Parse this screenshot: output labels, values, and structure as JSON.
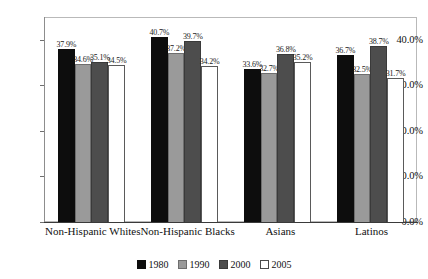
{
  "chart_data": {
    "type": "bar",
    "title": "",
    "subtitle": "",
    "xlabel": "",
    "ylabel": "",
    "categories": [
      "Non-Hispanic Whites",
      "Non-Hispanic Blacks",
      "Asians",
      "Latinos"
    ],
    "series": [
      {
        "name": "1980",
        "color": "#0d0d0d",
        "values": [
          37.9,
          40.7,
          33.6,
          36.7
        ],
        "labels": [
          "37.9%",
          "40.7%",
          "33.6%",
          "36.7%"
        ]
      },
      {
        "name": "1990",
        "color": "#9a9a9a",
        "values": [
          34.6,
          37.2,
          32.7,
          32.5
        ],
        "labels": [
          "34.6%",
          "37.2%",
          "32.7%",
          "32.5%"
        ]
      },
      {
        "name": "2000",
        "color": "#4d4d4d",
        "values": [
          35.1,
          39.7,
          36.8,
          38.7
        ],
        "labels": [
          "35.1%",
          "39.7%",
          "36.8%",
          "38.7%"
        ]
      },
      {
        "name": "2005",
        "color": "#ffffff",
        "values": [
          34.5,
          34.2,
          35.2,
          31.7
        ],
        "labels": [
          "34.5%",
          "34.2%",
          "35.2%",
          "31.7%"
        ]
      }
    ],
    "ylim": [
      0,
      45
    ],
    "yticks": [
      0,
      10,
      20,
      30,
      40
    ],
    "ytick_labels": [
      "0.0%",
      "10.0%",
      "20.0%",
      "30.0%",
      "40.0%"
    ],
    "grid": false,
    "legend_position": "bottom",
    "legend_entries": [
      "1980",
      "1990",
      "2000",
      "2005"
    ]
  }
}
